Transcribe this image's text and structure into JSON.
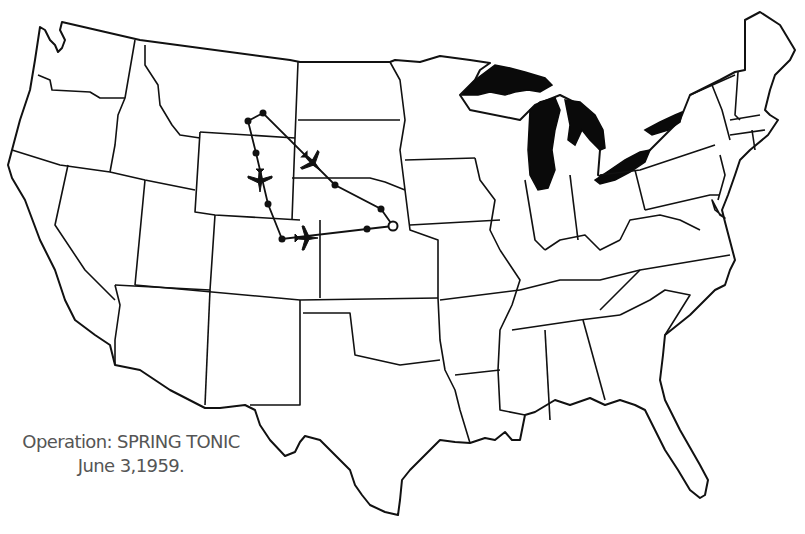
{
  "map": {
    "title": "United States state outline map",
    "style": {
      "line_color": "#111111",
      "background": "#ffffff",
      "lake_fill": "#0a0a0a",
      "caption_color": "#555555"
    }
  },
  "caption": {
    "line1": "Operation: SPRING TONIC",
    "line2": "June 3,1959."
  },
  "route": {
    "origin_marker": "open-circle",
    "waypoints": [
      {
        "x": 393,
        "y": 226,
        "type": "origin"
      },
      {
        "x": 381,
        "y": 209,
        "type": "waypoint"
      },
      {
        "x": 335,
        "y": 185,
        "type": "waypoint"
      },
      {
        "x": 263,
        "y": 113,
        "type": "waypoint"
      },
      {
        "x": 248,
        "y": 121,
        "type": "waypoint"
      },
      {
        "x": 256,
        "y": 153,
        "type": "waypoint"
      },
      {
        "x": 268,
        "y": 204,
        "type": "waypoint"
      },
      {
        "x": 282,
        "y": 239,
        "type": "waypoint"
      },
      {
        "x": 367,
        "y": 229,
        "type": "waypoint"
      }
    ],
    "aircraft": [
      {
        "name": "aircraft-northeast-leg",
        "x": 312,
        "y": 162,
        "rotation": 135
      },
      {
        "name": "aircraft-southbound-leg",
        "x": 260,
        "y": 180,
        "rotation": 180
      },
      {
        "name": "aircraft-east-leg",
        "x": 306,
        "y": 238,
        "rotation": 90
      }
    ]
  }
}
